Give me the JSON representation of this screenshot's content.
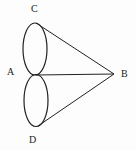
{
  "diagram": {
    "labels": {
      "a": "A",
      "b": "B",
      "c": "C",
      "d": "D"
    },
    "points": {
      "A": [
        36,
        75
      ],
      "B": [
        114,
        74
      ],
      "C": [
        35,
        23
      ],
      "D": [
        38,
        126
      ]
    },
    "stroke_color": "#222222"
  }
}
